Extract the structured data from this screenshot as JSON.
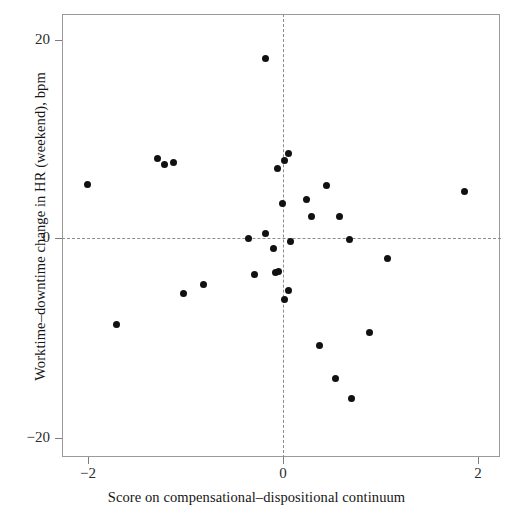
{
  "chart_data": {
    "type": "scatter",
    "title": "",
    "xlabel": "Score on compensational–dispositional continuum",
    "ylabel": "Worktime–downtime change in HR (weekend), bpm",
    "xlim": [
      -2.27,
      2.22
    ],
    "ylim": [
      -22.4,
      22.4
    ],
    "xticks": [
      -2,
      0,
      2
    ],
    "xticklabels": [
      "−2",
      "0",
      "2"
    ],
    "yticks": [
      20,
      0,
      -20
    ],
    "yticklabels": [
      "20",
      "0",
      "−20"
    ],
    "grid": false,
    "legend": null,
    "reference_lines": [
      {
        "orientation": "horizontal",
        "value": 0,
        "style": "dashed"
      },
      {
        "orientation": "vertical",
        "value": 0,
        "style": "dashed"
      }
    ],
    "marker": {
      "shape": "circle",
      "color": "#111111",
      "size": 7
    },
    "points": [
      {
        "x": -0.18,
        "y": 18.0
      },
      {
        "x": -1.29,
        "y": 8.0
      },
      {
        "x": -1.22,
        "y": 7.4
      },
      {
        "x": -1.12,
        "y": 7.6
      },
      {
        "x": 0.06,
        "y": 8.5
      },
      {
        "x": 0.02,
        "y": 7.8
      },
      {
        "x": -0.06,
        "y": 7.0
      },
      {
        "x": -2.01,
        "y": 5.4
      },
      {
        "x": 0.45,
        "y": 5.3
      },
      {
        "x": 1.86,
        "y": 4.7
      },
      {
        "x": 0.24,
        "y": 3.9
      },
      {
        "x": -0.01,
        "y": 3.5
      },
      {
        "x": 0.29,
        "y": 2.2
      },
      {
        "x": 0.58,
        "y": 2.2
      },
      {
        "x": -0.35,
        "y": 0.0
      },
      {
        "x": -0.18,
        "y": 0.5
      },
      {
        "x": 0.68,
        "y": -0.1
      },
      {
        "x": 0.08,
        "y": -0.3
      },
      {
        "x": -0.1,
        "y": -1.0
      },
      {
        "x": 1.07,
        "y": -2.0
      },
      {
        "x": -0.29,
        "y": -3.6
      },
      {
        "x": -0.08,
        "y": -3.4
      },
      {
        "x": -0.05,
        "y": -3.3
      },
      {
        "x": -0.82,
        "y": -4.6
      },
      {
        "x": -1.02,
        "y": -5.5
      },
      {
        "x": 0.06,
        "y": -5.2
      },
      {
        "x": 0.02,
        "y": -6.1
      },
      {
        "x": -1.71,
        "y": -8.6
      },
      {
        "x": 0.37,
        "y": -10.7
      },
      {
        "x": 0.89,
        "y": -9.4
      },
      {
        "x": 0.54,
        "y": -14.0
      },
      {
        "x": 0.7,
        "y": -16.0
      }
    ]
  },
  "axes": {
    "x_title": "Score on compensational–dispositional continuum",
    "y_title": "Worktime–downtime change in HR (weekend), bpm",
    "x_tick_labels": [
      "−2",
      "0",
      "2"
    ],
    "y_tick_labels": [
      "20",
      "0",
      "−20"
    ]
  },
  "colors": {
    "marker": "#111111",
    "frame": "#9a9a9a",
    "reference_line": "#8d8d8d",
    "text": "#161616",
    "background": "#ffffff"
  }
}
